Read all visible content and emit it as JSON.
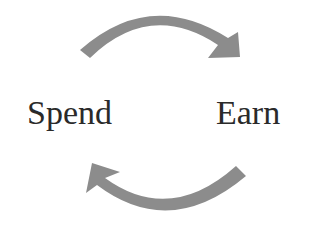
{
  "diagram": {
    "type": "cycle",
    "nodes": [
      {
        "id": "spend",
        "label": "Spend"
      },
      {
        "id": "earn",
        "label": "Earn"
      }
    ],
    "edges": [
      {
        "from": "spend",
        "to": "earn",
        "position": "top"
      },
      {
        "from": "earn",
        "to": "spend",
        "position": "bottom"
      }
    ],
    "colors": {
      "arrow": "#8c8c8c",
      "text": "#2a2a2a",
      "background": "#ffffff"
    }
  }
}
